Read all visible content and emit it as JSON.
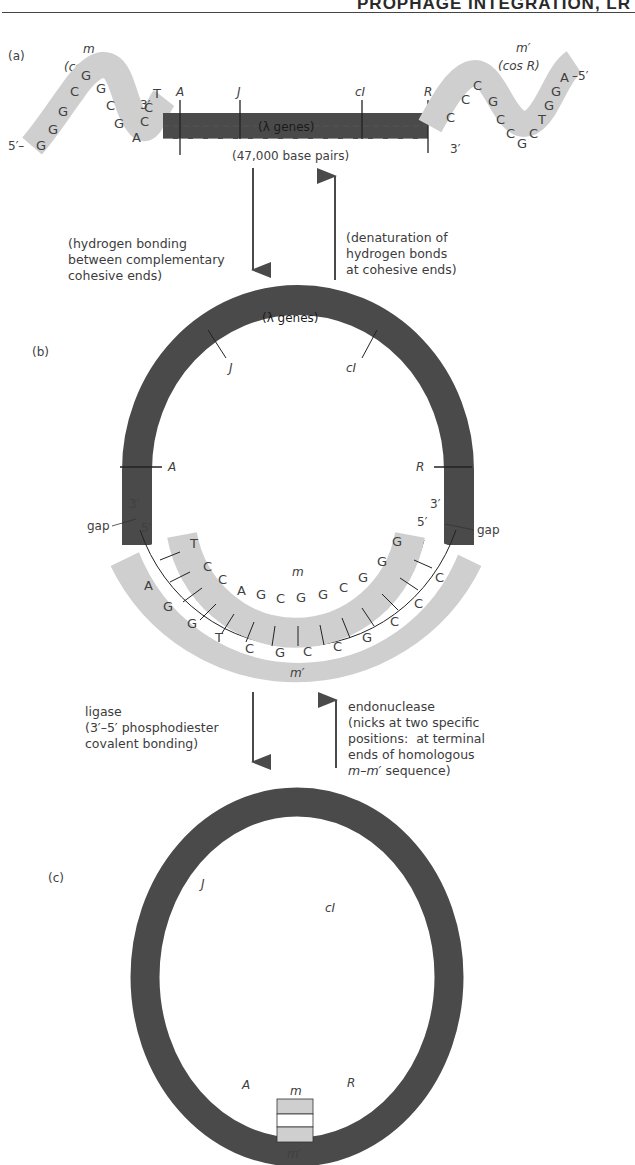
{
  "header": {
    "running_title": "PROPHAGE INTEGRATION, LR"
  },
  "panel_a": {
    "label": "(a)",
    "left_end": {
      "name": "m",
      "site": "(cos L)",
      "five_prime": "5′–",
      "three_prime": "3′",
      "sequence": [
        "G",
        "G",
        "G",
        "C",
        "G",
        "G",
        "C",
        "G",
        "A",
        "C",
        "C",
        "T"
      ]
    },
    "right_end": {
      "name": "m′",
      "site": "(cos R)",
      "five_prime": "–5′",
      "three_prime": "3′",
      "sequence": [
        "C",
        "C",
        "C",
        "G",
        "C",
        "C",
        "G",
        "C",
        "T",
        "G",
        "G",
        "A"
      ]
    },
    "genes_label": "(λ genes)",
    "length_label": "(47,000 base pairs)",
    "markers": [
      "A",
      "J",
      "cI",
      "R"
    ]
  },
  "transition_ab": {
    "down_text": "(hydrogen bonding\nbetween complementary\ncohesive ends)",
    "up_text": "(denaturation of\nhydrogen bonds\nat cohesive ends)"
  },
  "panel_b": {
    "label": "(b)",
    "genes_label": "(λ genes)",
    "markers": [
      "J",
      "cI",
      "A",
      "R"
    ],
    "left_ends": {
      "three_prime": "3′",
      "five_prime": "5′",
      "gap": "gap"
    },
    "right_ends": {
      "three_prime": "3′",
      "five_prime": "5′",
      "gap": "gap"
    },
    "inner_strand": {
      "name": "m",
      "sequence": [
        "T",
        "C",
        "C",
        "A",
        "G",
        "C",
        "G",
        "G",
        "C",
        "G",
        "G",
        "G"
      ]
    },
    "outer_strand": {
      "name": "m′",
      "sequence": [
        "A",
        "G",
        "G",
        "T",
        "C",
        "G",
        "C",
        "C",
        "G",
        "C",
        "C",
        "C"
      ]
    }
  },
  "transition_bc": {
    "down_text": "ligase\n(3′–5′ phosphodiester\ncovalent bonding)",
    "up_text_line1": "endonuclease\n(nicks at two specific\npositions:  at terminal\nends of homologous",
    "up_text_m": "m–m′",
    "up_text_tail": " sequence)"
  },
  "panel_c": {
    "label": "(c)",
    "markers": [
      "J",
      "cI",
      "A",
      "R"
    ],
    "joint_top": "m",
    "joint_bottom": "m′"
  },
  "colors": {
    "dna_dark": "#4a4a4a",
    "cohesive_gray": "#cfcfcf",
    "text": "#404040",
    "line": "#333333"
  }
}
